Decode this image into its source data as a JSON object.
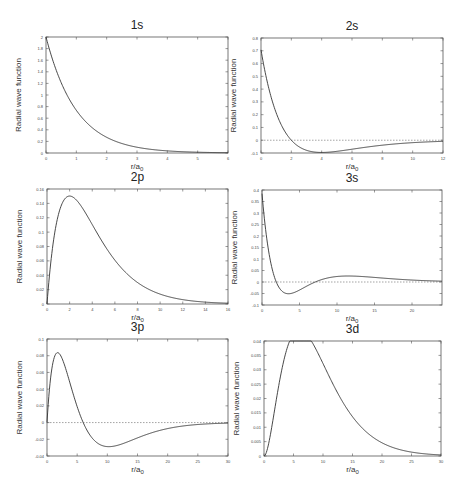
{
  "chart_data": [
    {
      "id": "1s",
      "type": "line",
      "title": "1s",
      "xlabel": "r/a0",
      "ylabel": "Radial wave function",
      "xlim": [
        0,
        6
      ],
      "ylim": [
        0,
        2
      ],
      "xticks": [
        0,
        1,
        2,
        3,
        4,
        5,
        6
      ],
      "xtick_labels": [
        "0",
        "1",
        "2",
        "3",
        "4",
        "5",
        "6"
      ],
      "yticks": [
        0,
        0.2,
        0.4,
        0.6,
        0.8,
        1,
        1.2,
        1.4,
        1.6,
        1.8,
        2
      ],
      "ytick_labels": [
        "0",
        "0.2",
        "0.4",
        "0.6",
        "0.8",
        "1",
        "1.2",
        "1.4",
        "1.6",
        "1.8",
        "2"
      ],
      "zero_line": false,
      "function": "2*exp(-r)",
      "sample_points": {
        "x": [
          0,
          0.5,
          1,
          2,
          3,
          4,
          5,
          6
        ],
        "y": [
          2.0,
          1.21,
          0.74,
          0.27,
          0.1,
          0.037,
          0.013,
          0.005
        ]
      },
      "frame": {
        "left": 46,
        "top": 37,
        "right": 228,
        "bottom": 153
      }
    },
    {
      "id": "2s",
      "type": "line",
      "title": "2s",
      "xlabel": "r/a0",
      "ylabel": "Radial wave function",
      "xlim": [
        0,
        12
      ],
      "ylim": [
        -0.1,
        0.8
      ],
      "xticks": [
        0,
        2,
        4,
        6,
        8,
        10,
        12
      ],
      "xtick_labels": [
        "0",
        "2",
        "4",
        "6",
        "8",
        "10",
        "12"
      ],
      "yticks": [
        -0.1,
        0,
        0.1,
        0.2,
        0.3,
        0.4,
        0.5,
        0.6,
        0.7,
        0.8
      ],
      "ytick_labels": [
        "-0.1",
        "0",
        "0.1",
        "0.2",
        "0.3",
        "0.4",
        "0.5",
        "0.6",
        "0.7",
        "0.8"
      ],
      "zero_line": true,
      "function": "(1/(2*sqrt(2)))*(2-r)*exp(-r/2)",
      "sample_points": {
        "x": [
          0,
          1,
          2,
          3,
          4,
          6,
          8,
          10,
          12
        ],
        "y": [
          0.707,
          0.214,
          0,
          -0.079,
          -0.096,
          -0.07,
          -0.039,
          -0.019,
          -0.009
        ]
      },
      "frame": {
        "left": 261,
        "top": 38,
        "right": 443,
        "bottom": 153
      }
    },
    {
      "id": "2p",
      "type": "line",
      "title": "2p",
      "xlabel": "r/a0",
      "ylabel": "Radial wave function",
      "xlim": [
        0,
        16
      ],
      "ylim": [
        0,
        0.16
      ],
      "xticks": [
        0,
        2,
        4,
        6,
        8,
        10,
        12,
        14,
        16
      ],
      "xtick_labels": [
        "0",
        "2",
        "4",
        "6",
        "8",
        "10",
        "12",
        "14",
        "16"
      ],
      "yticks": [
        0,
        0.02,
        0.04,
        0.06,
        0.08,
        0.1,
        0.12,
        0.14,
        0.16
      ],
      "ytick_labels": [
        "0",
        "0.02",
        "0.04",
        "0.06",
        "0.08",
        "0.1",
        "0.12",
        "0.14",
        "0.16"
      ],
      "zero_line": false,
      "function": "(1/(2*sqrt(6)))*r*exp(-r/2)",
      "sample_points": {
        "x": [
          0,
          1,
          2,
          4,
          6,
          8,
          10,
          12,
          14,
          16
        ],
        "y": [
          0,
          0.124,
          0.15,
          0.11,
          0.061,
          0.03,
          0.014,
          0.006,
          0.003,
          0.001
        ]
      },
      "frame": {
        "left": 47,
        "top": 189,
        "right": 228,
        "bottom": 304
      }
    },
    {
      "id": "3s",
      "type": "line",
      "title": "3s",
      "xlabel": "r/a0",
      "ylabel": "Radial wave function",
      "xlim": [
        0,
        24
      ],
      "ylim": [
        -0.1,
        0.4
      ],
      "xticks": [
        0,
        5,
        10,
        15,
        20
      ],
      "xtick_labels": [
        "0",
        "5",
        "10",
        "15",
        "20"
      ],
      "yticks": [
        -0.1,
        -0.05,
        0,
        0.05,
        0.1,
        0.15,
        0.2,
        0.25,
        0.3,
        0.35,
        0.4
      ],
      "ytick_labels": [
        "-0.1",
        "-0.05",
        "0",
        "0.05",
        "0.1",
        "0.15",
        "0.2",
        "0.25",
        "0.3",
        "0.35",
        "0.4"
      ],
      "zero_line": true,
      "function": "(2/(81*sqrt(3)))*(27-18r+2r^2)*exp(-r/3)",
      "sample_points": {
        "x": [
          0,
          1.9,
          3.5,
          7.1,
          10,
          12,
          15,
          20,
          24
        ],
        "y": [
          0.385,
          0,
          -0.051,
          0,
          0.025,
          0.027,
          0.022,
          0.012,
          0.006
        ]
      },
      "frame": {
        "left": 262,
        "top": 190,
        "right": 442,
        "bottom": 305
      }
    },
    {
      "id": "3p",
      "type": "line",
      "title": "3p",
      "xlabel": "r/a0",
      "ylabel": "Radial wave function",
      "xlim": [
        0,
        30
      ],
      "ylim": [
        -0.04,
        0.1
      ],
      "xticks": [
        0,
        5,
        10,
        15,
        20,
        25,
        30
      ],
      "xtick_labels": [
        "0",
        "5",
        "10",
        "15",
        "20",
        "25",
        "30"
      ],
      "yticks": [
        -0.04,
        -0.02,
        0,
        0.02,
        0.04,
        0.06,
        0.08,
        0.1
      ],
      "ytick_labels": [
        "-0.04",
        "-0.02",
        "0",
        "0.02",
        "0.04",
        "0.06",
        "0.08",
        "0.1"
      ],
      "zero_line": true,
      "function": "(4/(81*sqrt(6)))*(6-r)*r*exp(-r/3)",
      "sample_points": {
        "x": [
          0,
          1.8,
          4,
          6,
          8,
          10.2,
          15,
          20,
          25,
          30
        ],
        "y": [
          0,
          0.085,
          0.043,
          0,
          -0.026,
          -0.033,
          -0.025,
          -0.014,
          -0.006,
          -0.002
        ]
      },
      "frame": {
        "left": 47,
        "top": 339,
        "right": 228,
        "bottom": 456
      }
    },
    {
      "id": "3d",
      "type": "line",
      "title": "3d",
      "xlabel": "r/a0",
      "ylabel": "Radial wave function",
      "xlim": [
        0,
        30
      ],
      "ylim": [
        0,
        0.04
      ],
      "xticks": [
        0,
        5,
        10,
        15,
        20,
        25,
        30
      ],
      "xtick_labels": [
        "0",
        "5",
        "10",
        "15",
        "20",
        "25",
        "30"
      ],
      "yticks": [
        0,
        0.005,
        0.01,
        0.015,
        0.02,
        0.025,
        0.03,
        0.035,
        0.04
      ],
      "ytick_labels": [
        "0",
        "0.005",
        "0.01",
        "0.015",
        "0.02",
        "0.025",
        "0.03",
        "0.035",
        "0.04"
      ],
      "zero_line": false,
      "function": "(4/(81*sqrt(30)))*r^2*exp(-r/3)",
      "sample_points": {
        "x": [
          0,
          3,
          6,
          9,
          12,
          15,
          20,
          25,
          30
        ],
        "y": [
          0,
          0.03,
          0.038,
          0.031,
          0.022,
          0.013,
          0.005,
          0.002,
          0.001
        ]
      },
      "frame": {
        "left": 264,
        "top": 341,
        "right": 441,
        "bottom": 456
      }
    }
  ]
}
